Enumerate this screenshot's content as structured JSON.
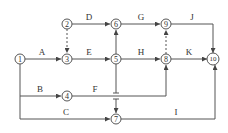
{
  "diagram": {
    "type": "network-planning-diagram",
    "colors": {
      "line": "#555555",
      "text": "#333333",
      "background": "#ffffff"
    },
    "nodes": [
      {
        "id": "1",
        "label": "1",
        "x": 20,
        "y": 59
      },
      {
        "id": "2",
        "label": "2",
        "x": 67,
        "y": 24
      },
      {
        "id": "3",
        "label": "3",
        "x": 67,
        "y": 59
      },
      {
        "id": "4",
        "label": "4",
        "x": 67,
        "y": 96
      },
      {
        "id": "5",
        "label": "5",
        "x": 116,
        "y": 59
      },
      {
        "id": "6",
        "label": "6",
        "x": 116,
        "y": 24
      },
      {
        "id": "7",
        "label": "7",
        "x": 116,
        "y": 119
      },
      {
        "id": "8",
        "label": "8",
        "x": 166,
        "y": 59
      },
      {
        "id": "9",
        "label": "9",
        "x": 166,
        "y": 24
      },
      {
        "id": "10",
        "label": "10",
        "x": 213,
        "y": 59
      }
    ],
    "activities": [
      {
        "label": "A",
        "from": "1",
        "to": "3",
        "type": "solid"
      },
      {
        "label": "B",
        "from": "1",
        "to": "4",
        "type": "solid"
      },
      {
        "label": "C",
        "from": "1",
        "to": "7",
        "type": "solid"
      },
      {
        "label": "D",
        "from": "2",
        "to": "6",
        "type": "solid"
      },
      {
        "label": "E",
        "from": "3",
        "to": "5",
        "type": "solid"
      },
      {
        "label": "F",
        "from": "4",
        "to": "8",
        "type": "solid"
      },
      {
        "label": "G",
        "from": "6",
        "to": "9",
        "type": "solid"
      },
      {
        "label": "H",
        "from": "5",
        "to": "8",
        "type": "solid"
      },
      {
        "label": "I",
        "from": "7",
        "to": "10",
        "type": "solid"
      },
      {
        "label": "J",
        "from": "9",
        "to": "10",
        "type": "solid"
      },
      {
        "label": "K",
        "from": "8",
        "to": "10",
        "type": "solid"
      },
      {
        "label": "",
        "from": "2",
        "to": "3",
        "type": "dummy"
      },
      {
        "label": "",
        "from": "8",
        "to": "9",
        "type": "dummy"
      },
      {
        "label": "",
        "from": "5",
        "to": "6",
        "type": "solid"
      },
      {
        "label": "",
        "from": "5",
        "to": "7",
        "type": "solid"
      }
    ]
  }
}
